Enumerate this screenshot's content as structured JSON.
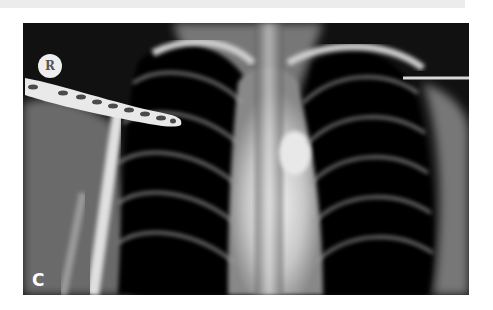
{
  "figure": {
    "panel_label": "C",
    "marker_label": "R",
    "colors": {
      "background": "#000000",
      "bone": "#e8e8e8",
      "page": "#ffffff"
    }
  }
}
